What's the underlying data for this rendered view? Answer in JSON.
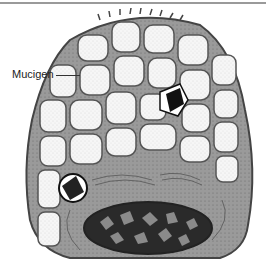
{
  "figure": {
    "labels": [
      {
        "text": "Mucigen",
        "target": "mucigen granules"
      }
    ]
  },
  "colors": {
    "outline": "#444444",
    "cytoplasm": "#8c8c8c",
    "granule_fill": "#f4f4f4",
    "nucleus": "#2a2a2a",
    "rule": "#9a9a9a"
  }
}
